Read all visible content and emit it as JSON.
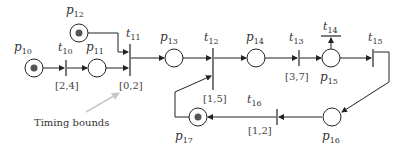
{
  "diagram": {
    "type": "timed-petri-net",
    "colors": {
      "stroke": "#222222",
      "token": "#555555",
      "annotation_arrow": "#c8c8c8"
    },
    "places": [
      {
        "id": "p10",
        "label": "p",
        "sub": "10",
        "token": true
      },
      {
        "id": "p11",
        "label": "p",
        "sub": "11",
        "token": false
      },
      {
        "id": "p12",
        "label": "p",
        "sub": "12",
        "token": true
      },
      {
        "id": "p13",
        "label": "p",
        "sub": "13",
        "token": false
      },
      {
        "id": "p14",
        "label": "p",
        "sub": "14",
        "token": false
      },
      {
        "id": "p15",
        "label": "p",
        "sub": "15",
        "token": false
      },
      {
        "id": "p16",
        "label": "p",
        "sub": "16",
        "token": false
      },
      {
        "id": "p17",
        "label": "p",
        "sub": "17",
        "token": true
      }
    ],
    "transitions": [
      {
        "id": "t10",
        "label": "t",
        "sub": "10",
        "bound": "[2,4]"
      },
      {
        "id": "t11",
        "label": "t",
        "sub": "11",
        "bound": "[0,2]"
      },
      {
        "id": "t12",
        "label": "t",
        "sub": "12",
        "bound": "[1,5]"
      },
      {
        "id": "t13",
        "label": "t",
        "sub": "13",
        "bound": "[3,7]"
      },
      {
        "id": "t14",
        "label": "t",
        "sub": "14",
        "bound": ""
      },
      {
        "id": "t15",
        "label": "t",
        "sub": "15",
        "bound": ""
      },
      {
        "id": "t16",
        "label": "t",
        "sub": "16",
        "bound": "[1,2]"
      }
    ],
    "arcs": [
      [
        "p10",
        "t10"
      ],
      [
        "t10",
        "p11"
      ],
      [
        "p11",
        "t11"
      ],
      [
        "p12",
        "t11"
      ],
      [
        "t11",
        "p13"
      ],
      [
        "p13",
        "t12"
      ],
      [
        "p17",
        "t12"
      ],
      [
        "t12",
        "p14"
      ],
      [
        "p14",
        "t13"
      ],
      [
        "t13",
        "p15"
      ],
      [
        "p15",
        "t14"
      ],
      [
        "p15",
        "t15"
      ],
      [
        "t15",
        "p16"
      ],
      [
        "p16",
        "t16"
      ],
      [
        "t16",
        "p17"
      ]
    ],
    "annotation": {
      "text": "Timing bounds",
      "points_to": "t11"
    }
  }
}
